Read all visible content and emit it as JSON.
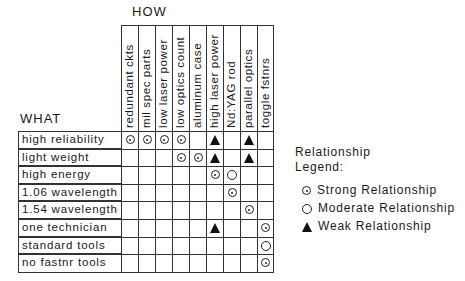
{
  "header": {
    "how_label": "HOW",
    "what_label": "WHAT"
  },
  "columns": [
    "redundant ckts",
    "mil spec parts",
    "low laser power",
    "low optics count",
    "aluminum case",
    "high laser power",
    "Nd:YAG rod",
    "parallel optics",
    "toggle fstnrs"
  ],
  "rows": [
    {
      "label": "high reliability",
      "cells": [
        "strong",
        "strong",
        "strong",
        "strong",
        "",
        "weak",
        "",
        "weak",
        ""
      ]
    },
    {
      "label": "light weight",
      "cells": [
        "",
        "",
        "",
        "strong",
        "strong",
        "weak",
        "",
        "weak",
        ""
      ]
    },
    {
      "label": "high energy",
      "cells": [
        "",
        "",
        "",
        "",
        "",
        "strong",
        "moderate",
        "",
        ""
      ]
    },
    {
      "label": "1.06 wavelength",
      "cells": [
        "",
        "",
        "",
        "",
        "",
        "",
        "strong",
        "",
        ""
      ]
    },
    {
      "label": "1.54 wavelength",
      "cells": [
        "",
        "",
        "",
        "",
        "",
        "",
        "",
        "strong",
        ""
      ]
    },
    {
      "label": "one technician",
      "cells": [
        "",
        "",
        "",
        "",
        "",
        "weak",
        "",
        "",
        "strong"
      ]
    },
    {
      "label": "standard tools",
      "cells": [
        "",
        "",
        "",
        "",
        "",
        "",
        "",
        "",
        "moderate"
      ]
    },
    {
      "label": "no fastnr tools",
      "cells": [
        "",
        "",
        "",
        "",
        "",
        "",
        "",
        "",
        "strong"
      ]
    }
  ],
  "legend": {
    "title_line1": "Relationship",
    "title_line2": "Legend:",
    "items": [
      {
        "symbol": "strong",
        "label": "Strong Relationship"
      },
      {
        "symbol": "moderate",
        "label": "Moderate Relationship"
      },
      {
        "symbol": "weak",
        "label": "Weak Relationship"
      }
    ]
  }
}
